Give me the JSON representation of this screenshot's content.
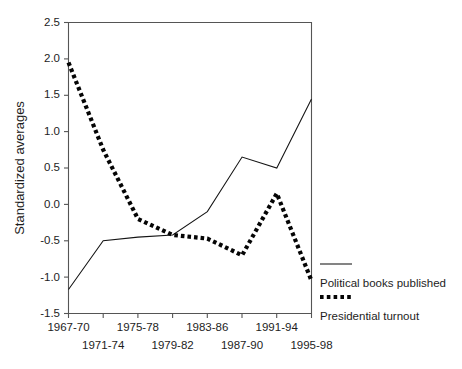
{
  "chart_data": {
    "type": "line",
    "title": "",
    "xlabel": "",
    "ylabel": "Standardized averages",
    "categories": [
      "1967-70",
      "1971-74",
      "1975-78",
      "1979-82",
      "1983-86",
      "1987-90",
      "1991-94",
      "1995-98"
    ],
    "xtick_labels_row1": [
      "1967-70",
      "1975-78",
      "1983-86",
      "1991-94"
    ],
    "xtick_labels_row2": [
      "1971-74",
      "1979-82",
      "1987-90",
      "1995-98"
    ],
    "ytick_labels": [
      "2.5",
      "2.0",
      "1.5",
      "1.0",
      "0.5",
      "0.0",
      "-0.5",
      "-1.0",
      "-1.5"
    ],
    "ytick_values": [
      2.5,
      2.0,
      1.5,
      1.0,
      0.5,
      0.0,
      -0.5,
      -1.0,
      -1.5
    ],
    "ylim": [
      -1.5,
      2.5
    ],
    "grid": false,
    "legend_position": "right",
    "series": [
      {
        "name": "Political books published",
        "style": "solid",
        "color": "#141414",
        "values": [
          -1.17,
          -0.5,
          -0.45,
          -0.42,
          -0.1,
          0.65,
          0.5,
          1.45
        ]
      },
      {
        "name": "Presidential turnout",
        "style": "dotted",
        "color": "#050505",
        "values": [
          1.95,
          0.75,
          -0.2,
          -0.42,
          -0.47,
          -0.7,
          0.15,
          -1.05
        ]
      }
    ]
  },
  "axis": {
    "y_title": "Standardized averages"
  },
  "legend": {
    "items": [
      {
        "label": "Political books published",
        "style": "solid"
      },
      {
        "label": "Presidential turnout",
        "style": "dotted"
      }
    ]
  }
}
